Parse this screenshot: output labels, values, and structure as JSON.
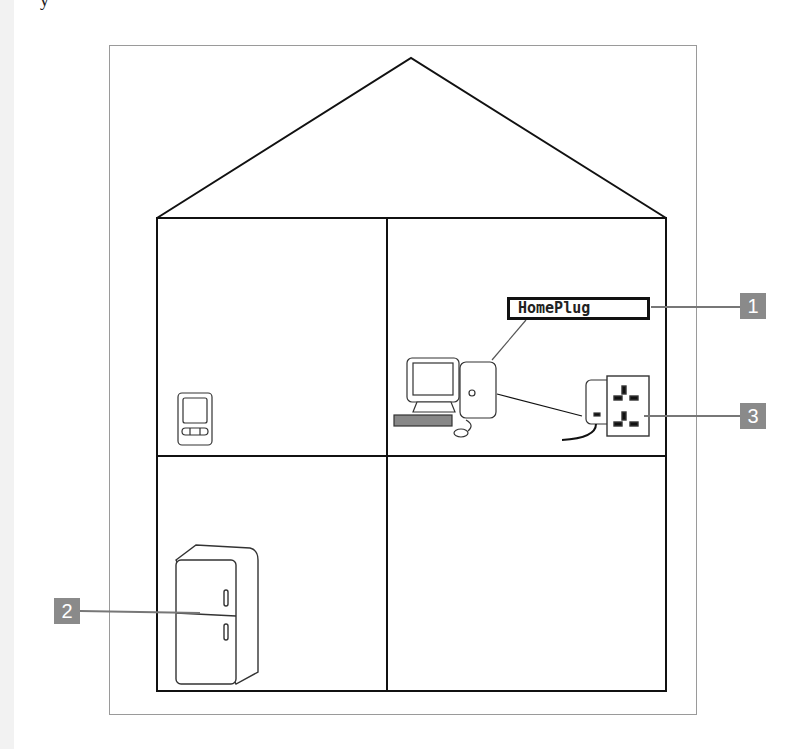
{
  "diagram": {
    "title_fragment": "y",
    "label_box": {
      "text": "HomePlug"
    },
    "callouts": [
      {
        "number": "1",
        "target": "HomePlug label"
      },
      {
        "number": "2",
        "target": "refrigerator"
      },
      {
        "number": "3",
        "target": "powerline adapter at wall socket"
      }
    ],
    "rooms": [
      "upper-left",
      "upper-right",
      "lower-left",
      "lower-right"
    ],
    "devices": {
      "computer": "desktop computer with monitor, keyboard and mouse",
      "adapter": "powerline adapter plugged into wall socket",
      "remote": "handheld control unit",
      "fridge": "refrigerator"
    },
    "colors": {
      "callout_bg": "#8a8a8a",
      "line": "#111111",
      "leader": "#777777",
      "frame": "#9a9a9a"
    }
  }
}
